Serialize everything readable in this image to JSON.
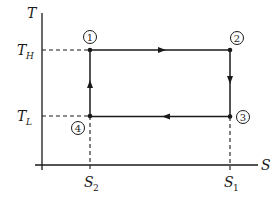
{
  "diagram": {
    "type": "T-S diagram (Carnot cycle)",
    "axes": {
      "y_label": "T",
      "x_label": "S",
      "y_ticks": [
        {
          "label_main": "T",
          "label_sub": "H"
        },
        {
          "label_main": "T",
          "label_sub": "L"
        }
      ],
      "x_ticks": [
        {
          "label_main": "S",
          "label_sub": "2"
        },
        {
          "label_main": "S",
          "label_sub": "1"
        }
      ]
    },
    "states": [
      {
        "id": "1",
        "position": "T_H, S_2"
      },
      {
        "id": "2",
        "position": "T_H, S_1"
      },
      {
        "id": "3",
        "position": "T_L, S_1"
      },
      {
        "id": "4",
        "position": "T_L, S_2"
      }
    ],
    "processes": [
      {
        "from": "1",
        "to": "2",
        "direction": "right"
      },
      {
        "from": "2",
        "to": "3",
        "direction": "down"
      },
      {
        "from": "3",
        "to": "4",
        "direction": "left"
      },
      {
        "from": "4",
        "to": "1",
        "direction": "up"
      }
    ],
    "colors": {
      "ink": "#1a1a1a",
      "background": "#ffffff"
    }
  }
}
